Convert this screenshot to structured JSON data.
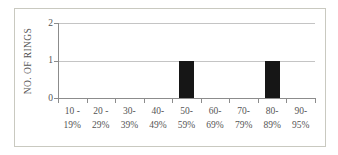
{
  "chart_data": {
    "type": "bar",
    "title": "",
    "ylabel": "NO. OF RINGS",
    "xlabel": "",
    "categories": [
      {
        "line1": "10 -",
        "line2": "19%"
      },
      {
        "line1": "20 -",
        "line2": "29%"
      },
      {
        "line1": "30-",
        "line2": "39%"
      },
      {
        "line1": "40-",
        "line2": "49%"
      },
      {
        "line1": "50-",
        "line2": "59%"
      },
      {
        "line1": "60-",
        "line2": "69%"
      },
      {
        "line1": "70-",
        "line2": "79%"
      },
      {
        "line1": "80-",
        "line2": "89%"
      },
      {
        "line1": "90-",
        "line2": "95%"
      }
    ],
    "values": [
      0,
      0,
      0,
      0,
      1,
      0,
      0,
      1,
      0
    ],
    "yticks": [
      0,
      1,
      2
    ],
    "ylim": [
      0,
      2
    ],
    "grid": true,
    "legend": "none",
    "bar_color": "#161616",
    "gridline_color": "#c4c4c4",
    "axis_color": "#8c8c8c",
    "text_color": "#555555",
    "frame_border_color": "#c9c9c0",
    "background": "#ffffff"
  }
}
